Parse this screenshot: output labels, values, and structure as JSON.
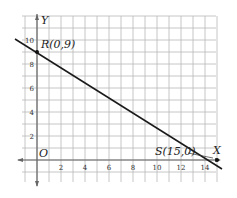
{
  "chart_data": {
    "type": "line",
    "title": "",
    "xlabel": "X",
    "ylabel": "Y",
    "origin_label": "O",
    "xlim": [
      -1,
      15.5
    ],
    "ylim": [
      -1.5,
      11
    ],
    "grid": true,
    "x_ticks": [
      "2",
      "4",
      "6",
      "8",
      "10",
      "12",
      "14"
    ],
    "y_ticks": [
      "2",
      "4",
      "6",
      "8",
      "10"
    ],
    "series": [
      {
        "name": "line RS",
        "x": [
          0,
          15
        ],
        "y": [
          9,
          0
        ]
      }
    ],
    "points": [
      {
        "label": "R(0,9)",
        "x": 0,
        "y": 9
      },
      {
        "label": "S(15,0)",
        "x": 15,
        "y": 0
      }
    ],
    "colors": {
      "line": "#1a1a1a",
      "grid": "#b5b5b5",
      "axis": "#555555"
    }
  }
}
